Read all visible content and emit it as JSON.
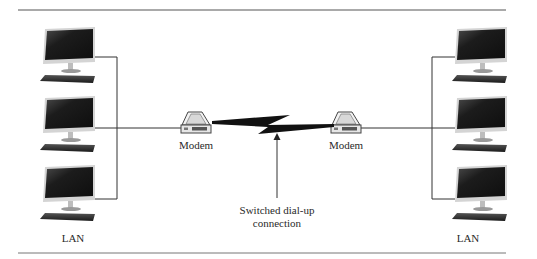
{
  "diagram": {
    "type": "network",
    "left_lan": {
      "label": "LAN",
      "computers": 3
    },
    "right_lan": {
      "label": "LAN",
      "computers": 3
    },
    "left_modem": {
      "label": "Modem"
    },
    "right_modem": {
      "label": "Modem"
    },
    "connection": {
      "label_line1": "Switched dial-up",
      "label_line2": "connection",
      "icon": "lightning-bolt-icon"
    }
  },
  "colors": {
    "line": "#333333",
    "monitor_screen": "#1e1e1e",
    "monitor_frame": "#c9c9c9",
    "keyboard": "#2a2a2a",
    "modem_body": "#e9e9e9",
    "rule": "#555555"
  }
}
